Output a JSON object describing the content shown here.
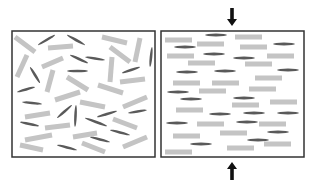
{
  "diagram": {
    "colors": {
      "background": "#ffffff",
      "box_border": "#333333",
      "light_rod": "#c4c4c4",
      "dark_rod": "#5a5a5a",
      "arrow": "#111111"
    },
    "panels": [
      {
        "id": "random",
        "label": "Random orientation",
        "box": {
          "x": 12,
          "y": 31,
          "w": 143,
          "h": 126
        },
        "light_rods": [
          [
            15,
            37,
            35,
            52
          ],
          [
            48,
            48,
            73,
            46
          ],
          [
            102,
            37,
            127,
            43
          ],
          [
            110,
            47,
            130,
            62
          ],
          [
            140,
            38,
            135,
            62
          ],
          [
            17,
            77,
            27,
            55
          ],
          [
            42,
            67,
            63,
            58
          ],
          [
            112,
            57,
            110,
            82
          ],
          [
            47,
            92,
            53,
            70
          ],
          [
            67,
            77,
            88,
            90
          ],
          [
            120,
            82,
            145,
            79
          ],
          [
            98,
            85,
            123,
            93
          ],
          [
            55,
            100,
            80,
            92
          ],
          [
            80,
            102,
            105,
            107
          ],
          [
            123,
            107,
            147,
            97
          ],
          [
            25,
            117,
            50,
            113
          ],
          [
            113,
            119,
            137,
            128
          ],
          [
            45,
            128,
            70,
            125
          ],
          [
            73,
            137,
            97,
            133
          ],
          [
            25,
            140,
            52,
            135
          ],
          [
            123,
            147,
            147,
            137
          ],
          [
            20,
            145,
            43,
            150
          ],
          [
            82,
            143,
            105,
            152
          ]
        ],
        "dark_rods": [
          [
            38,
            45,
            55,
            35
          ],
          [
            67,
            35,
            85,
            45
          ],
          [
            152,
            47,
            150,
            67
          ],
          [
            70,
            55,
            88,
            63
          ],
          [
            85,
            57,
            105,
            60
          ],
          [
            30,
            67,
            40,
            83
          ],
          [
            67,
            71,
            88,
            71
          ],
          [
            122,
            73,
            140,
            67
          ],
          [
            17,
            92,
            35,
            87
          ],
          [
            22,
            102,
            42,
            104
          ],
          [
            57,
            118,
            72,
            105
          ],
          [
            76,
            105,
            75,
            127
          ],
          [
            97,
            117,
            117,
            111
          ],
          [
            128,
            113,
            147,
            110
          ],
          [
            20,
            122,
            39,
            126
          ],
          [
            85,
            118,
            107,
            126
          ],
          [
            110,
            130,
            130,
            135
          ],
          [
            90,
            137,
            110,
            142
          ],
          [
            57,
            145,
            77,
            150
          ]
        ]
      },
      {
        "id": "aligned",
        "label": "Aligned orientation under compression",
        "box": {
          "x": 161,
          "y": 31,
          "w": 143,
          "h": 126
        },
        "light_rods": [
          [
            165,
            40,
            27
          ],
          [
            197,
            44,
            27
          ],
          [
            235,
            37,
            27
          ],
          [
            240,
            47,
            27
          ],
          [
            267,
            56,
            27
          ],
          [
            167,
            56,
            27
          ],
          [
            188,
            63,
            27
          ],
          [
            245,
            64,
            27
          ],
          [
            255,
            78,
            27
          ],
          [
            173,
            83,
            27
          ],
          [
            212,
            83,
            27
          ],
          [
            199,
            91,
            27
          ],
          [
            249,
            89,
            27
          ],
          [
            270,
            102,
            27
          ],
          [
            232,
            105,
            27
          ],
          [
            176,
            110,
            27
          ],
          [
            197,
            124,
            27
          ],
          [
            259,
            124,
            27
          ],
          [
            220,
            133,
            27
          ],
          [
            173,
            136,
            27
          ],
          [
            264,
            144,
            27
          ],
          [
            227,
            148,
            27
          ],
          [
            165,
            152,
            27
          ]
        ],
        "dark_rods": [
          [
            205,
            35,
            22
          ],
          [
            174,
            47,
            22
          ],
          [
            273,
            44,
            22
          ],
          [
            203,
            54,
            22
          ],
          [
            233,
            58,
            22
          ],
          [
            176,
            72,
            22
          ],
          [
            214,
            71,
            22
          ],
          [
            277,
            70,
            22
          ],
          [
            167,
            92,
            22
          ],
          [
            180,
            99,
            22
          ],
          [
            233,
            98,
            22
          ],
          [
            209,
            114,
            22
          ],
          [
            243,
            113,
            22
          ],
          [
            277,
            113,
            22
          ],
          [
            166,
            123,
            22
          ],
          [
            236,
            122,
            22
          ],
          [
            267,
            132,
            22
          ],
          [
            190,
            144,
            22
          ],
          [
            247,
            140,
            22
          ]
        ]
      }
    ],
    "arrows": [
      {
        "id": "top",
        "direction": "down",
        "x": 232,
        "y1": 8,
        "y2": 26
      },
      {
        "id": "bottom",
        "direction": "up",
        "x": 232,
        "y1": 180,
        "y2": 162
      }
    ]
  }
}
